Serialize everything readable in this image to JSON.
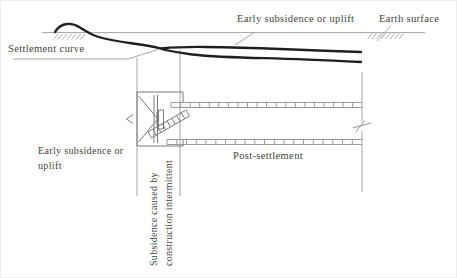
{
  "diagram": {
    "labels": {
      "early_subsidence_top": "Early subsidence or uplift",
      "earth_surface": "Earth surface",
      "settlement_curve": "Settlement curve",
      "early_subsidence_left_line1": "Early subsidence or",
      "early_subsidence_left_line2": "uplift",
      "post_settlement": "Post-settlement",
      "subsidence_rotated_line1": "Subsidence caused by",
      "subsidence_rotated_line2": "construction intermittent"
    },
    "colors": {
      "background": "#ffffff",
      "settlement_curve_stroke": "#1f1f1f",
      "construction_line_stroke": "#9b9b9b",
      "machine_stroke": "#7a7a7a",
      "text": "#3f3f3f"
    }
  }
}
